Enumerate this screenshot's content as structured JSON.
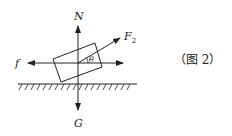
{
  "diagram": {
    "type": "free-body-diagram",
    "forces": [
      {
        "name": "N",
        "direction": "up"
      },
      {
        "name": "G",
        "direction": "down"
      },
      {
        "name": "f",
        "direction": "left"
      },
      {
        "name": "F",
        "subscript": "2",
        "direction": "up-right at angle theta above horizontal"
      }
    ],
    "angle_label": "θ",
    "caption": "（图 2）",
    "colors": {
      "stroke": "#222222",
      "background": "#ffffff"
    }
  }
}
